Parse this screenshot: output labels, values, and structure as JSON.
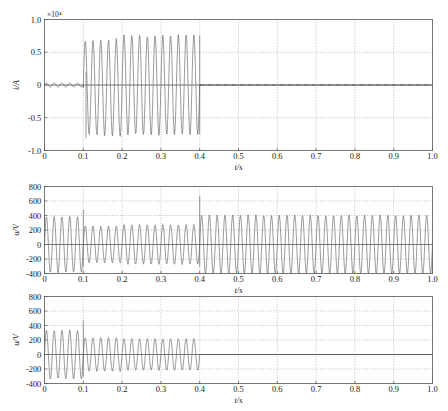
{
  "figure": {
    "kind": "multi-panel-time-series",
    "panel_count": 3,
    "caption": ""
  },
  "panels": [
    {
      "id": "panel-current",
      "ylabel": "i/A",
      "xlabel": "t/s",
      "exponent_label": "×10⁴",
      "ylim": [
        -1.0,
        1.0
      ],
      "yticks": [
        "-1.0",
        "-0.5",
        "0",
        "0.5",
        "1.0"
      ],
      "ytick_values": [
        -1.0,
        -0.5,
        0,
        0.5,
        1.0
      ],
      "xlim": [
        0,
        1.0
      ],
      "xticks": [
        "0",
        "0.1",
        "0.2",
        "0.3",
        "0.4",
        "0.5",
        "0.6",
        "0.7",
        "0.8",
        "0.9",
        "1.0"
      ],
      "xtick_values": [
        0,
        0.1,
        0.2,
        0.3,
        0.4,
        0.5,
        0.6,
        0.7,
        0.8,
        0.9,
        1.0
      ],
      "grid": true
    },
    {
      "id": "panel-voltage-upper",
      "ylabel": "u/V",
      "xlabel": "t/s",
      "exponent_label": "",
      "ylim": [
        -400,
        800
      ],
      "yticks": [
        "-400",
        "-200",
        "0",
        "200",
        "400",
        "600",
        "800"
      ],
      "ytick_values": [
        -400,
        -200,
        0,
        200,
        400,
        600,
        800
      ],
      "xlim": [
        0,
        1.0
      ],
      "xticks": [
        "0",
        "0.1",
        "0.2",
        "0.3",
        "0.4",
        "0.5",
        "0.6",
        "0.7",
        "0.8",
        "0.9",
        "1.0"
      ],
      "xtick_values": [
        0,
        0.1,
        0.2,
        0.3,
        0.4,
        0.5,
        0.6,
        0.7,
        0.8,
        0.9,
        1.0
      ],
      "grid": true
    },
    {
      "id": "panel-voltage-lower",
      "ylabel": "u/V",
      "xlabel": "t/s",
      "exponent_label": "",
      "ylim": [
        -400,
        800
      ],
      "yticks": [
        "-400",
        "-200",
        "0",
        "200",
        "400",
        "600",
        "800"
      ],
      "ytick_values": [
        -400,
        -200,
        0,
        200,
        400,
        600,
        800
      ],
      "xlim": [
        0,
        1.0
      ],
      "xticks": [
        "0",
        "0.1",
        "0.2",
        "0.3",
        "0.4",
        "0.5",
        "0.6",
        "0.7",
        "0.8",
        "0.9",
        "1.0"
      ],
      "xtick_values": [
        0,
        0.1,
        0.2,
        0.3,
        0.4,
        0.5,
        0.6,
        0.7,
        0.8,
        0.9,
        1.0
      ],
      "grid": true
    }
  ],
  "chart_data": [
    {
      "type": "line",
      "id": "fault-current",
      "title": "",
      "xlabel": "t/s",
      "ylabel": "i/A",
      "y_scale_exponent": "×10⁴",
      "xlim": [
        0,
        1.0
      ],
      "ylim": [
        -10000,
        10000
      ],
      "grid": true,
      "legend": null,
      "series": [
        {
          "name": "i",
          "description": "Small ripple near zero until t=0.1 s; large oscillation 0.1-0.4 s with envelope growing from about 5500 A to 7500 A peak; zero after t=0.4 s.",
          "segments": [
            {
              "t_start": 0.0,
              "t_end": 0.1,
              "amplitude": 300,
              "frequency_hz": 50,
              "offset": 0
            },
            {
              "t_start": 0.1,
              "t_end": 0.2,
              "amplitude_start": 7000,
              "amplitude_end": 7400,
              "frequency_hz": 50,
              "offset": -400,
              "first_peak": -8100
            },
            {
              "t_start": 0.2,
              "t_end": 0.4,
              "amplitude_start": 7500,
              "amplitude_end": 7500,
              "frequency_hz": 50,
              "offset": 0
            },
            {
              "t_start": 0.4,
              "t_end": 1.0,
              "amplitude": 0,
              "frequency_hz": 0,
              "offset": 0
            }
          ],
          "key_values": {
            "max_positive_peak": 7600,
            "max_negative_peak": -8100,
            "peak_time_s": 0.107,
            "fault_start_s": 0.1,
            "fault_clear_s": 0.4
          }
        }
      ]
    },
    {
      "type": "line",
      "id": "voltage-upper",
      "title": "",
      "xlabel": "t/s",
      "ylabel": "u/V",
      "y_scale_exponent": "",
      "xlim": [
        0,
        1.0
      ],
      "ylim": [
        -400,
        800
      ],
      "grid": true,
      "legend": null,
      "series": [
        {
          "name": "u",
          "description": "Continuous 50 Hz voltage for the whole window; amplitude about ±380 V before 0.1 s, reduced to about ±250 V between 0.1 and 0.4 s, and restored to about ±400 V after 0.4 s; transient spikes to about 470 V at t=0.1 s and about 660 V at t=0.4 s.",
          "segments": [
            {
              "t_start": 0.0,
              "t_end": 0.1,
              "amplitude": 380,
              "frequency_hz": 50,
              "offset": 0
            },
            {
              "t_start": 0.1,
              "t_end": 0.2,
              "amplitude": 250,
              "frequency_hz": 50,
              "offset": 0
            },
            {
              "t_start": 0.2,
              "t_end": 0.4,
              "amplitude": 270,
              "frequency_hz": 50,
              "offset": 0
            },
            {
              "t_start": 0.4,
              "t_end": 1.0,
              "amplitude": 400,
              "frequency_hz": 50,
              "offset": 0
            }
          ],
          "key_values": {
            "spike_1_time_s": 0.1,
            "spike_1_value": 470,
            "spike_2_time_s": 0.4,
            "spike_2_value": 660,
            "steady_amplitude_after_clear": 400,
            "sag_amplitude": 250
          }
        }
      ]
    },
    {
      "type": "line",
      "id": "voltage-lower",
      "title": "",
      "xlabel": "t/s",
      "ylabel": "u/V",
      "y_scale_exponent": "",
      "xlim": [
        0,
        1.0
      ],
      "ylim": [
        -400,
        800
      ],
      "grid": true,
      "legend": null,
      "series": [
        {
          "name": "u",
          "description": "50 Hz voltage with amplitude about ±330 V before 0.1 s, spike to about 460 V at t=0.1 s, then reduced amplitude about ±230 V from 0.1 to 0.2 s and about ±215 V from 0.2 to 0.4 s; collapses to zero after t=0.4 s.",
          "segments": [
            {
              "t_start": 0.0,
              "t_end": 0.1,
              "amplitude": 330,
              "frequency_hz": 50,
              "offset": 0
            },
            {
              "t_start": 0.1,
              "t_end": 0.2,
              "amplitude": 230,
              "frequency_hz": 50,
              "offset": 0
            },
            {
              "t_start": 0.2,
              "t_end": 0.4,
              "amplitude": 215,
              "frequency_hz": 50,
              "offset": 0
            },
            {
              "t_start": 0.4,
              "t_end": 1.0,
              "amplitude": 0,
              "frequency_hz": 0,
              "offset": 0
            }
          ],
          "key_values": {
            "spike_time_s": 0.1,
            "spike_value": 460,
            "collapse_time_s": 0.4
          }
        }
      ]
    }
  ]
}
